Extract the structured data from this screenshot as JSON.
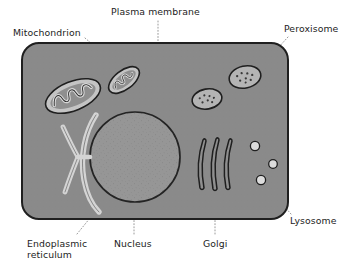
{
  "figure": {
    "background_color": "#ffffff"
  },
  "colors": {
    "cytoplasm": "#8a8a8a",
    "cytoplasm_outline": "#1f1f1f",
    "nucleus_fill": "#969696",
    "nucleus_outline": "#242424",
    "organelle_light": "#c8c8c8",
    "organelle_outline": "#1f1f1f",
    "label_text": "#1c1c1c",
    "leader_line": "#9a9a9a"
  },
  "labels": [
    {
      "id": "mitochondrion",
      "text": "Mitochondrion",
      "leader": "diagonal",
      "points_to": "mitochondrion-large"
    },
    {
      "id": "plasma-membrane",
      "text": "Plasma membrane",
      "leader": "vertical-dotted",
      "points_to": "cell-outline"
    },
    {
      "id": "peroxisome",
      "text": "Peroxisome",
      "leader": "diagonal",
      "points_to": "peroxisome-upper"
    },
    {
      "id": "lysosome",
      "text": "Lysosome",
      "leader": "diagonal",
      "points_to": "lysosome-lower"
    },
    {
      "id": "endoplasmic-reticulum",
      "text": "Endoplasmic\nreticulum",
      "leader": "diagonal",
      "points_to": "endoplasmic-reticulum"
    },
    {
      "id": "nucleus",
      "text": "Nucleus",
      "leader": "vertical-dotted",
      "points_to": "nucleus"
    },
    {
      "id": "golgi",
      "text": "Golgi",
      "leader": "vertical-dotted",
      "points_to": "golgi-apparatus"
    }
  ],
  "structures": [
    {
      "id": "cell-outline",
      "name": "Plasma membrane",
      "count": 1
    },
    {
      "id": "mitochondrion-large",
      "name": "Mitochondrion",
      "count": 1
    },
    {
      "id": "mitochondrion-small",
      "name": "Mitochondrion",
      "count": 1
    },
    {
      "id": "peroxisome-upper",
      "name": "Peroxisome",
      "count": 1
    },
    {
      "id": "peroxisome-lower",
      "name": "Peroxisome",
      "count": 1
    },
    {
      "id": "nucleus",
      "name": "Nucleus",
      "count": 1
    },
    {
      "id": "endoplasmic-reticulum",
      "name": "Endoplasmic reticulum",
      "count": 1
    },
    {
      "id": "golgi-apparatus",
      "name": "Golgi",
      "cisternae": 3
    },
    {
      "id": "lysosomes",
      "name": "Lysosome",
      "count": 3
    }
  ]
}
